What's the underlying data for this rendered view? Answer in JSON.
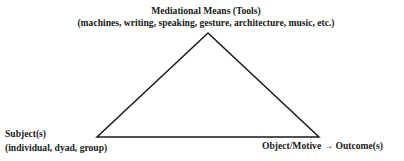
{
  "diagram": {
    "type": "activity-theory-triangle",
    "nodes": {
      "top": {
        "title": "Mediational Means (Tools)",
        "subtitle": "(machines, writing, speaking, gesture, architecture, music, etc.)"
      },
      "bottom_left": {
        "title": "Subject(s)",
        "subtitle": "(individual, dyad, group)"
      },
      "bottom_right": {
        "title": "Object/Motive",
        "arrow": "→",
        "outcome": "Outcome(s)"
      }
    },
    "colors": {
      "line": "#1a1a1a",
      "text": "#1a1a1a",
      "background": "#ffffff"
    }
  }
}
